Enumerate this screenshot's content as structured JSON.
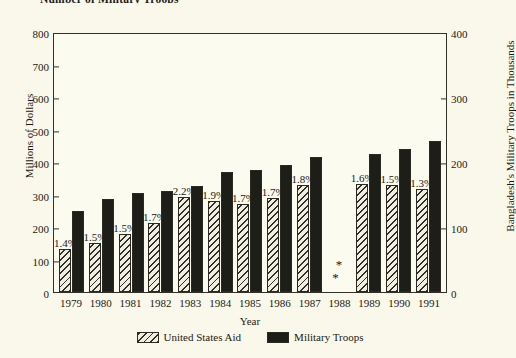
{
  "chart_title": "Number of Military Troops",
  "axes": {
    "xlabel": "Year",
    "ylabel_left": "Millions of Dollars",
    "ylabel_right": "Bangladesh's Military Troops in Thousands",
    "yticks_left": [
      800,
      700,
      600,
      500,
      400,
      300,
      200,
      100,
      0
    ],
    "yticks_right": [
      400,
      300,
      200,
      100,
      0
    ],
    "ylim_left": [
      0,
      800
    ],
    "ylim_right": [
      0,
      400
    ]
  },
  "legend": {
    "position": "bottom-center",
    "items": [
      {
        "label": "United States Aid",
        "swatch": "hatched-diagonal"
      },
      {
        "label": "Military Troops",
        "swatch": "solid-black"
      }
    ]
  },
  "colors": {
    "background": "#faf8ea",
    "plot_background": "#fcfbf0",
    "frame": "#32322a",
    "aid_bar": "#efeee0",
    "troops_bar": "#1e1e18",
    "text": "#1a1a14"
  },
  "no_data_marker": "* *",
  "chart_data": {
    "type": "bar",
    "title": "Number of Military Troops",
    "xlabel": "Year",
    "ylabel": "Millions of Dollars",
    "ylabel_secondary": "Bangladesh's Military Troops in Thousands",
    "ylim": [
      0,
      800
    ],
    "ylim_secondary": [
      0,
      400
    ],
    "grid": false,
    "legend_position": "bottom-center",
    "categories": [
      "1979",
      "1980",
      "1981",
      "1982",
      "1983",
      "1984",
      "1985",
      "1986",
      "1987",
      "1988",
      "1989",
      "1990",
      "1991"
    ],
    "series": [
      {
        "name": "United States Aid",
        "axis": "left",
        "unit": "Millions of Dollars",
        "values": [
          132,
          152,
          178,
          212,
          292,
          280,
          270,
          288,
          330,
          null,
          332,
          328,
          317
        ]
      },
      {
        "name": "Military Troops",
        "axis": "right",
        "unit": "Thousands",
        "values": [
          125,
          143,
          152,
          155,
          163,
          185,
          187,
          196,
          207,
          null,
          212,
          220,
          232
        ]
      }
    ],
    "point_labels": [
      "1.4%",
      "1.5%",
      "1.5%",
      "1.7%",
      "2.2%",
      "1.9%",
      "1.7%",
      "1.7%",
      "1.8%",
      null,
      "1.6%",
      "1.5%",
      "1.3%"
    ],
    "annotations": [
      {
        "category": "1988",
        "text": "* *",
        "note": "no data shown for 1988"
      }
    ]
  },
  "bars": [
    {
      "year": "1979",
      "aid": 132,
      "troops": 125,
      "pct": "1.4%"
    },
    {
      "year": "1980",
      "aid": 152,
      "troops": 143,
      "pct": "1.5%"
    },
    {
      "year": "1981",
      "aid": 178,
      "troops": 152,
      "pct": "1.5%"
    },
    {
      "year": "1982",
      "aid": 212,
      "troops": 155,
      "pct": "1.7%"
    },
    {
      "year": "1983",
      "aid": 292,
      "troops": 163,
      "pct": "2.2%"
    },
    {
      "year": "1984",
      "aid": 280,
      "troops": 185,
      "pct": "1.9%"
    },
    {
      "year": "1985",
      "aid": 270,
      "troops": 187,
      "pct": "1.7%"
    },
    {
      "year": "1986",
      "aid": 288,
      "troops": 196,
      "pct": "1.7%"
    },
    {
      "year": "1987",
      "aid": 330,
      "troops": 207,
      "pct": "1.8%"
    },
    {
      "year": "1988",
      "aid": null,
      "troops": null,
      "pct": null
    },
    {
      "year": "1989",
      "aid": 332,
      "troops": 212,
      "pct": "1.6%"
    },
    {
      "year": "1990",
      "aid": 328,
      "troops": 220,
      "pct": "1.5%"
    },
    {
      "year": "1991",
      "aid": 317,
      "troops": 232,
      "pct": "1.3%"
    }
  ]
}
